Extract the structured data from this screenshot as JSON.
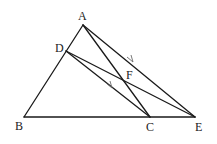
{
  "diagram": {
    "type": "geometry",
    "points": [
      {
        "name": "A",
        "x": 83,
        "y": 25,
        "label_x": 78,
        "label_y": 20
      },
      {
        "name": "D",
        "x": 66,
        "y": 51,
        "label_x": 55,
        "label_y": 52
      },
      {
        "name": "B",
        "x": 24,
        "y": 117,
        "label_x": 15,
        "label_y": 130
      },
      {
        "name": "C",
        "x": 150,
        "y": 117,
        "label_x": 146,
        "label_y": 131
      },
      {
        "name": "E",
        "x": 195,
        "y": 117,
        "label_x": 195,
        "label_y": 131
      },
      {
        "name": "F",
        "x": 125,
        "y": 81,
        "label_x": 126,
        "label_y": 79
      }
    ],
    "segments": [
      {
        "from": "A",
        "to": "B"
      },
      {
        "from": "B",
        "to": "E"
      },
      {
        "from": "A",
        "to": "C"
      },
      {
        "from": "A",
        "to": "E"
      },
      {
        "from": "D",
        "to": "C"
      },
      {
        "from": "D",
        "to": "E"
      }
    ],
    "parallel_marks": [
      {
        "segment": "AE",
        "x": 131,
        "y": 61
      },
      {
        "segment": "DC",
        "x": 110,
        "y": 86
      }
    ],
    "labels": {
      "A": "A",
      "B": "B",
      "C": "C",
      "D": "D",
      "E": "E",
      "F": "F"
    },
    "colors": {
      "line": "#1a1a1a",
      "label": "#222222",
      "mark": "#6a6a6a",
      "background": "#ffffff"
    }
  }
}
